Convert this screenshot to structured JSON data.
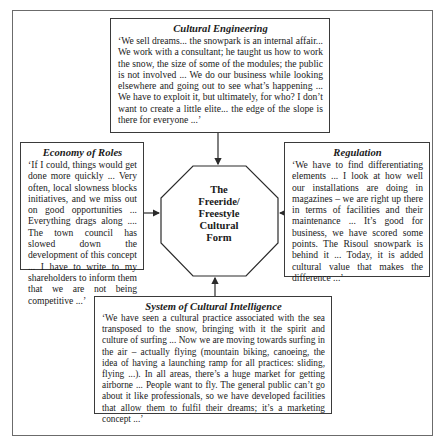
{
  "diagram": {
    "center": {
      "lines": [
        "The",
        "Freeride/",
        "Freestyle",
        "Cultural",
        "Form"
      ]
    },
    "boxes": {
      "top": {
        "title": "Cultural Engineering",
        "quote": "‘We sell dreams... the snowpark is an internal affair... We work with a consultant; he taught us how to work the snow, the size of some of the modules; the public is not involved ... We do our business while looking elsewhere and going out to see what’s happening ... We have to exploit it, but ultimately, for who? I don’t want to create a little elite... the edge of the slope is there for everyone ...’"
      },
      "left": {
        "title": "Economy of Roles",
        "quote": "‘If I could, things would get done more quickly ... Very often, local slowness blocks initiatives, and we miss out on good opportunities ... Everything drags along .... The town council has slowed down the development of this concept ... I have to write to my shareholders to inform them that we are not being competitive ...’"
      },
      "right": {
        "title": "Regulation",
        "quote": "‘We have to find differentiating elements ... I look at how well our installations are doing in magazines – we are right up there in terms of facilities and their maintenance ... It’s good for business, we have scored some points. The Risoul snowpark is behind it ... Today, it is added cultural value that makes the difference ...’"
      },
      "bottom": {
        "title": "System of Cultural Intelligence",
        "quote": "‘We have seen a cultural practice associated with the sea transposed to the snow, bringing with it the spirit and culture of surfing ... Now we are moving towards surfing in the air – actually flying (mountain biking, canoeing, the idea of having a launching ramp for all practices: sliding, flying ...). In all areas, there’s a huge market for getting airborne ... People want to fly. The general public can’t go about it like professionals, so we have developed facilities that allow them to fulfil their dreams; it’s a marketing concept ...’"
      }
    },
    "colors": {
      "line": "#2a2a2a",
      "frame": "#6b6b6b",
      "background": "#ffffff"
    }
  }
}
